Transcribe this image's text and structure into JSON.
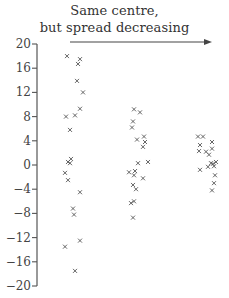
{
  "chart_data": {
    "type": "scatter",
    "title": "Same centre, but spread decreasing",
    "title_lines": [
      "Same centre,",
      "but spread decreasing"
    ],
    "xlabel": "",
    "ylabel": "",
    "ylim": [
      -20,
      20
    ],
    "yticks": [
      20,
      16,
      12,
      8,
      4,
      0,
      -4,
      -8,
      -12,
      -16,
      -20
    ],
    "ytick_labels": [
      "20",
      "16",
      "12",
      "8",
      "4",
      "0",
      "−4",
      "−8",
      "−12",
      "−16",
      "−20"
    ],
    "grid": false,
    "legend": null,
    "marker": "x",
    "annotation": {
      "type": "arrow",
      "direction": "right",
      "meaning": "spread decreasing"
    },
    "series": [
      {
        "name": "Group 1 (wide spread)",
        "points": [
          {
            "x": 67,
            "y": 18.0
          },
          {
            "x": 80,
            "y": 17.5
          },
          {
            "x": 78,
            "y": 16.7
          },
          {
            "x": 77,
            "y": 13.9
          },
          {
            "x": 83,
            "y": 12.0
          },
          {
            "x": 80,
            "y": 9.3
          },
          {
            "x": 66,
            "y": 8.0
          },
          {
            "x": 75,
            "y": 8.2
          },
          {
            "x": 70,
            "y": 5.8
          },
          {
            "x": 71,
            "y": 1.0
          },
          {
            "x": 68,
            "y": 0.5
          },
          {
            "x": 70,
            "y": 0.3
          },
          {
            "x": 65,
            "y": -1.3
          },
          {
            "x": 68,
            "y": -2.5
          },
          {
            "x": 80,
            "y": -4.5
          },
          {
            "x": 73,
            "y": -7.2
          },
          {
            "x": 74,
            "y": -8.2
          },
          {
            "x": 80,
            "y": -12.5
          },
          {
            "x": 65,
            "y": -13.5
          },
          {
            "x": 75,
            "y": -17.5
          }
        ]
      },
      {
        "name": "Group 2 (medium spread)",
        "points": [
          {
            "x": 134,
            "y": 9.2
          },
          {
            "x": 140,
            "y": 8.7
          },
          {
            "x": 133,
            "y": 7.2
          },
          {
            "x": 132,
            "y": 6.2
          },
          {
            "x": 137,
            "y": 4.2
          },
          {
            "x": 144,
            "y": 4.7
          },
          {
            "x": 145,
            "y": 3.8
          },
          {
            "x": 143,
            "y": 3.0
          },
          {
            "x": 138,
            "y": 0.3
          },
          {
            "x": 148,
            "y": 0.5
          },
          {
            "x": 135,
            "y": -1.0
          },
          {
            "x": 129,
            "y": -1.2
          },
          {
            "x": 134,
            "y": -1.7
          },
          {
            "x": 143,
            "y": -2.2
          },
          {
            "x": 133,
            "y": -3.3
          },
          {
            "x": 136,
            "y": -4.0
          },
          {
            "x": 131,
            "y": -6.3
          },
          {
            "x": 134,
            "y": -6.0
          },
          {
            "x": 133,
            "y": -8.7
          }
        ]
      },
      {
        "name": "Group 3 (narrow spread)",
        "points": [
          {
            "x": 198,
            "y": 4.7
          },
          {
            "x": 203,
            "y": 4.7
          },
          {
            "x": 200,
            "y": 3.3
          },
          {
            "x": 212,
            "y": 3.8
          },
          {
            "x": 199,
            "y": 2.3
          },
          {
            "x": 206,
            "y": 2.2
          },
          {
            "x": 212,
            "y": 2.7
          },
          {
            "x": 209,
            "y": 1.7
          },
          {
            "x": 211,
            "y": 0.3
          },
          {
            "x": 213,
            "y": 0.2
          },
          {
            "x": 216,
            "y": 0.5
          },
          {
            "x": 214,
            "y": -0.2
          },
          {
            "x": 208,
            "y": -0.3
          },
          {
            "x": 200,
            "y": -0.8
          },
          {
            "x": 215,
            "y": -1.7
          },
          {
            "x": 214,
            "y": -3.0
          },
          {
            "x": 212,
            "y": -4.2
          }
        ]
      }
    ]
  },
  "layout": {
    "axis_x": 37,
    "y_zero_px": 165,
    "px_per_unit": 6.05,
    "arrow": {
      "x1": 70,
      "x2": 212,
      "y": 42
    },
    "colors": {
      "axis": "#555555",
      "marker": "#555555",
      "text": "#333333",
      "arrow": "#444444"
    }
  }
}
